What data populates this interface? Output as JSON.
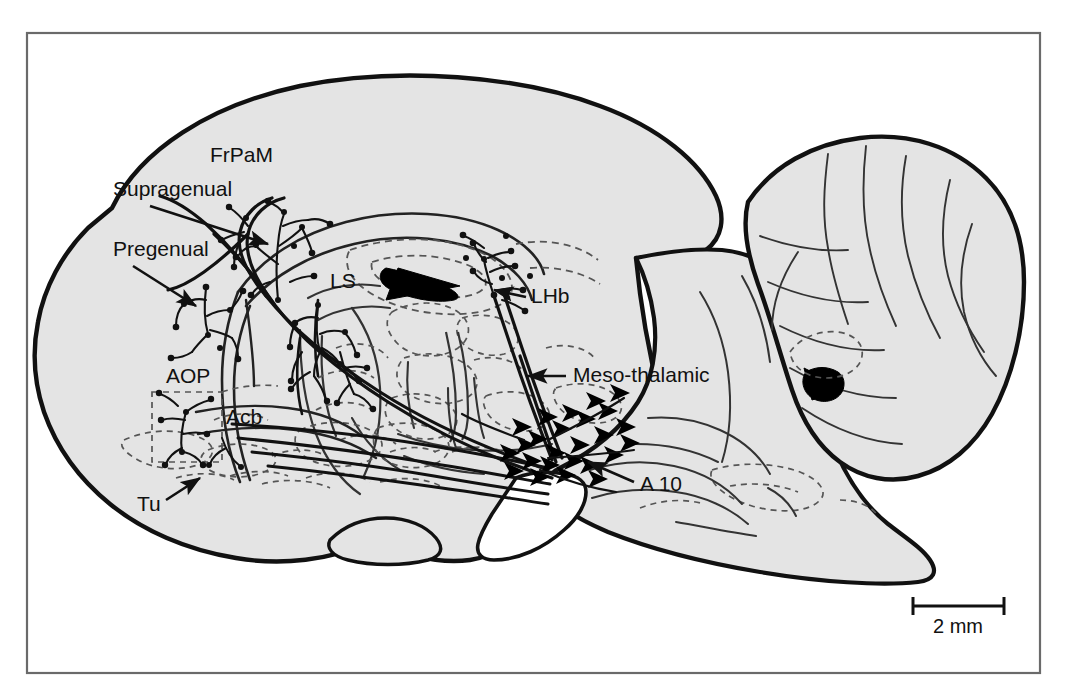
{
  "figure": {
    "type": "anatomical-diagram",
    "frame": {
      "stroke": "#555555",
      "fill": "#ffffff"
    },
    "colors": {
      "brain_fill": "#e4e4e4",
      "outline": "#111111",
      "interior_line": "#333333",
      "dashed_line": "#555555",
      "ventricle_fill": "#000000",
      "label_text": "#111111",
      "frame_stroke": "#666666",
      "page_background": "#ffffff"
    }
  },
  "labels": [
    {
      "id": "frpam",
      "text": "FrPaM",
      "x": 210,
      "y": 162,
      "anchor": "start",
      "has_arrow": false
    },
    {
      "id": "supragenual",
      "text": "Supragenual",
      "x": 113,
      "y": 196,
      "anchor": "start",
      "has_arrow": true
    },
    {
      "id": "pregenual",
      "text": "Pregenual",
      "x": 113,
      "y": 256,
      "anchor": "start",
      "has_arrow": true
    },
    {
      "id": "ls",
      "text": "LS",
      "x": 330,
      "y": 288,
      "anchor": "start",
      "has_arrow": false
    },
    {
      "id": "lhb",
      "text": "LHb",
      "x": 531,
      "y": 303,
      "anchor": "start",
      "has_arrow": true
    },
    {
      "id": "aop",
      "text": "AOP",
      "x": 166,
      "y": 383,
      "anchor": "start",
      "has_arrow": false
    },
    {
      "id": "acb",
      "text": "Acb",
      "x": 226,
      "y": 424,
      "anchor": "start",
      "has_arrow": false
    },
    {
      "id": "mesothalamic",
      "text": "Meso-thalamic",
      "x": 573,
      "y": 382,
      "anchor": "start",
      "has_arrow": true
    },
    {
      "id": "a10",
      "text": "A 10",
      "x": 640,
      "y": 491,
      "anchor": "start",
      "has_arrow": true
    },
    {
      "id": "tu",
      "text": "Tu",
      "x": 137,
      "y": 511,
      "anchor": "start",
      "has_arrow": true
    }
  ],
  "scale_bar": {
    "text": "2 mm",
    "x1": 913,
    "x2": 1004,
    "y": 606,
    "label_x": 958,
    "label_y": 632
  }
}
